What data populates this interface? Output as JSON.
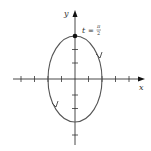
{
  "diagram": {
    "type": "parametric-ellipse",
    "x_axis_label": "x",
    "y_axis_label": "y",
    "point_label_t": "t",
    "point_label_eq": "=",
    "point_label_num": "π",
    "point_label_den": "2",
    "colors": {
      "curve": "#555555",
      "axis": "#333333",
      "point": "#111111"
    }
  }
}
